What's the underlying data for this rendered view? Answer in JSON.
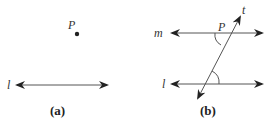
{
  "figure_a": {
    "caption": "(a)",
    "point_label": "P",
    "line_label": "l"
  },
  "figure_b": {
    "caption": "(b)",
    "line_m_label": "m",
    "line_l_label": "l",
    "transversal_label": "t",
    "intersection_label": "P"
  },
  "colors": {
    "line": "#555555",
    "arrowhead": "#222222",
    "text": "#333333"
  }
}
